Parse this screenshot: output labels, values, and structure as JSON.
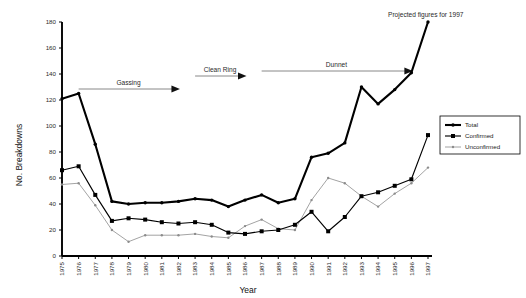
{
  "chart_data": {
    "type": "line",
    "title": "",
    "xlabel": "Year",
    "ylabel": "No. Breakdowns",
    "categories": [
      "1975",
      "1976",
      "1977",
      "1978",
      "1979",
      "1980",
      "1981",
      "1982",
      "1983",
      "1984",
      "1985",
      "1986",
      "1987",
      "1988",
      "1989",
      "1990",
      "1991",
      "1992",
      "1993",
      "1994",
      "1995",
      "1996",
      "1997"
    ],
    "x": [
      1975,
      1976,
      1977,
      1978,
      1979,
      1980,
      1981,
      1982,
      1983,
      1984,
      1985,
      1986,
      1987,
      1988,
      1989,
      1990,
      1991,
      1992,
      1993,
      1994,
      1995,
      1996,
      1997
    ],
    "ylim": [
      0,
      180
    ],
    "xlim": [
      1975,
      1997
    ],
    "yticks": [
      0,
      20,
      40,
      60,
      80,
      100,
      120,
      140,
      160,
      180
    ],
    "grid": false,
    "legend_position": "right",
    "series": [
      {
        "name": "Total",
        "values": [
          121,
          125,
          86,
          42,
          40,
          41,
          41,
          42,
          44,
          43,
          38,
          43,
          47,
          41,
          44,
          76,
          79,
          87,
          130,
          117,
          128,
          141,
          180
        ]
      },
      {
        "name": "Confirmed",
        "values": [
          66,
          69,
          47,
          27,
          29,
          28,
          26,
          25,
          26,
          24,
          18,
          17,
          19,
          20,
          24,
          34,
          19,
          30,
          46,
          49,
          54,
          59,
          93
        ]
      },
      {
        "name": "Unconfirmed",
        "values": [
          55,
          56,
          39,
          20,
          11,
          16,
          16,
          16,
          17,
          15,
          14,
          23,
          28,
          21,
          20,
          43,
          60,
          56,
          46,
          38,
          48,
          56,
          68
        ]
      }
    ],
    "annotations": [
      {
        "text": "Gassing",
        "start_year": 1976,
        "end_year": 1982
      },
      {
        "text": "Clean Ring",
        "start_year": 1983,
        "end_year": 1986
      },
      {
        "text": "Dunnet",
        "start_year": 1987,
        "end_year": 1996
      },
      {
        "text": "Projected figures for 1997"
      }
    ],
    "legend_entries": [
      "Total",
      "Confirmed",
      "Unconfirmed"
    ],
    "colors": {
      "total": "#000000",
      "confirmed": "#000000",
      "unconfirmed": "#8c8c8c",
      "annotation": "#7a7a7a",
      "background": "#ffffff"
    }
  }
}
